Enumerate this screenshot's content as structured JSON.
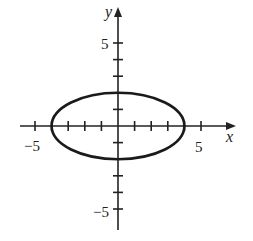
{
  "chart_data": {
    "type": "line",
    "title": "",
    "equation": "x^2/16 + y^2/4 = 1",
    "series": [
      {
        "name": "ellipse",
        "center": [
          0,
          0
        ],
        "semi_axis_x": 4,
        "semi_axis_y": 2,
        "vertices": [
          [
            -4,
            0
          ],
          [
            4,
            0
          ],
          [
            0,
            2
          ],
          [
            0,
            -2
          ]
        ]
      }
    ],
    "xlabel": "x",
    "ylabel": "y",
    "xlim": [
      -6,
      7
    ],
    "ylim": [
      -6,
      7
    ],
    "x_ticks": [
      -5,
      -4,
      -3,
      -2,
      -1,
      1,
      2,
      3,
      4,
      5
    ],
    "y_ticks": [
      -5,
      -4,
      -3,
      -2,
      -1,
      1,
      2,
      3,
      4,
      5
    ],
    "x_tick_labels": [
      "-5",
      "5"
    ],
    "y_tick_labels": [
      "5",
      "-5"
    ],
    "grid": false,
    "legend": null
  },
  "labels": {
    "x_axis": "x",
    "y_axis": "y",
    "x_neg5": "−5",
    "x_pos5": "5",
    "y_pos5": "5",
    "y_neg5": "−5"
  }
}
